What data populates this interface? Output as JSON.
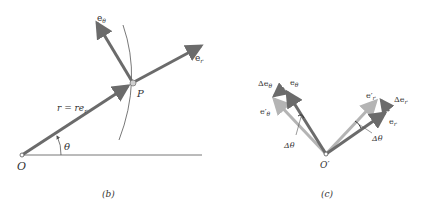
{
  "figures": [
    {
      "caption": "(b)",
      "labels": {
        "origin": "O",
        "point": "P",
        "e_theta": "e",
        "e_theta_sub": "θ",
        "e_r": "e",
        "e_r_sub": "r",
        "position_vector": "r = re",
        "position_vector_sub": "r",
        "angle": "θ"
      }
    },
    {
      "caption": "(c)",
      "labels": {
        "origin": "O′",
        "delta_e_theta": "Δe",
        "delta_e_theta_sub": "θ",
        "e_theta": "e",
        "e_theta_sub": "θ",
        "e_theta_prime": "e′",
        "e_theta_prime_sub": "θ",
        "delta_theta_left": "Δθ",
        "e_r_prime": "e′",
        "e_r_prime_sub": "r",
        "delta_e_r": "Δe",
        "delta_e_r_sub": "r",
        "e_r": "e",
        "e_r_sub": "r",
        "delta_theta_right": "Δθ"
      }
    }
  ],
  "colors": {
    "dark_vector": "#6b6b6b",
    "light_vector": "#b4b4b4",
    "line": "#777777",
    "text": "#333333"
  }
}
